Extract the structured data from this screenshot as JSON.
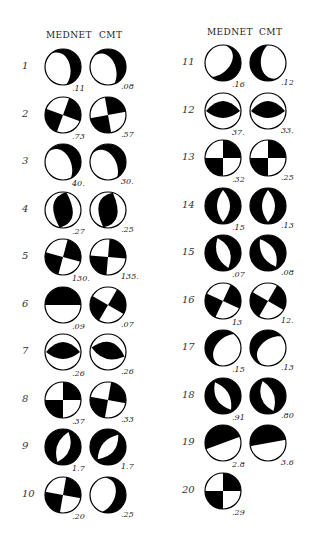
{
  "figure": {
    "columns": {
      "left": {
        "header_a": "MEDNET",
        "header_b": "CMT"
      },
      "right": {
        "header_a": "MEDNET",
        "header_b": "CMT"
      }
    },
    "events": [
      {
        "n": "1",
        "mednet": ".11",
        "cmt": ".08",
        "m_rot": -30,
        "c_rot": -40,
        "m_type": "dip",
        "c_type": "dip"
      },
      {
        "n": "2",
        "mednet": ".73",
        "cmt": ".57",
        "m_rot": 20,
        "c_rot": -10,
        "m_type": "quad",
        "c_type": "quad"
      },
      {
        "n": "3",
        "mednet": "40.",
        "cmt": "30.",
        "m_rot": -45,
        "c_rot": -50,
        "m_type": "dip",
        "c_type": "dip"
      },
      {
        "n": "4",
        "mednet": ".27",
        "cmt": ".25",
        "m_rot": 30,
        "c_rot": 35,
        "m_type": "lens",
        "c_type": "lens"
      },
      {
        "n": "5",
        "mednet": "130.",
        "cmt": "135.",
        "m_rot": 15,
        "c_rot": 5,
        "m_type": "quad",
        "c_type": "quad"
      },
      {
        "n": "6",
        "mednet": ".09",
        "cmt": ".07",
        "m_rot": 0,
        "c_rot": 30,
        "m_type": "half",
        "c_type": "quad"
      },
      {
        "n": "7",
        "mednet": ".26",
        "cmt": ".26",
        "m_rot": 0,
        "c_rot": 15,
        "m_type": "lensh",
        "c_type": "lensh"
      },
      {
        "n": "8",
        "mednet": ".37",
        "cmt": ".33",
        "m_rot": 0,
        "c_rot": 10,
        "m_type": "quad",
        "c_type": "quad"
      },
      {
        "n": "9",
        "mednet": "1.7",
        "cmt": "1.7",
        "m_rot": 20,
        "c_rot": 40,
        "m_type": "ring",
        "c_type": "ring"
      },
      {
        "n": "10",
        "mednet": ".20",
        "cmt": ".25",
        "m_rot": 10,
        "c_rot": 0,
        "m_type": "quad",
        "c_type": "dip"
      },
      {
        "n": "11",
        "mednet": ".16",
        "cmt": ".12",
        "m_rot": 20,
        "c_rot": 160,
        "m_type": "dip",
        "c_type": "dip"
      },
      {
        "n": "12",
        "mednet": "37.",
        "cmt": "33.",
        "m_rot": 0,
        "c_rot": 0,
        "m_type": "lensh",
        "c_type": "lensh"
      },
      {
        "n": "13",
        "mednet": ".32",
        "cmt": ".25",
        "m_rot": 0,
        "c_rot": 0,
        "m_type": "quad",
        "c_type": "quad"
      },
      {
        "n": "14",
        "mednet": ".15",
        "cmt": ".13",
        "m_rot": 0,
        "c_rot": 0,
        "m_type": "ring",
        "c_type": "ring"
      },
      {
        "n": "15",
        "mednet": ".07",
        "cmt": ".08",
        "m_rot": -20,
        "c_rot": -30,
        "m_type": "ring",
        "c_type": "ring"
      },
      {
        "n": "16",
        "mednet": "13",
        "cmt": "12.",
        "m_rot": 25,
        "c_rot": 30,
        "m_type": "quad",
        "c_type": "quad"
      },
      {
        "n": "17",
        "mednet": ".15",
        "cmt": ".13",
        "m_rot": 200,
        "c_rot": 210,
        "m_type": "dip",
        "c_type": "dip"
      },
      {
        "n": "18",
        "mednet": ".91",
        "cmt": ".80",
        "m_rot": 150,
        "c_rot": 160,
        "m_type": "ring",
        "c_type": "ring"
      },
      {
        "n": "19",
        "mednet": "2.8",
        "cmt": "3.6",
        "m_rot": -20,
        "c_rot": -10,
        "m_type": "half",
        "c_type": "half"
      },
      {
        "n": "20",
        "mednet": ".29",
        "cmt": null,
        "m_rot": 0,
        "c_rot": 0,
        "m_type": "quad",
        "c_type": null
      }
    ]
  }
}
